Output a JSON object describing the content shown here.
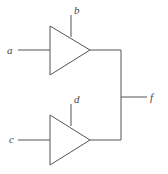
{
  "diagram": {
    "type": "tri-state buffer wired output",
    "stroke_color": "#555555",
    "labels": {
      "input_top": "a",
      "control_top": "b",
      "input_bottom": "c",
      "control_bottom": "d",
      "output": "f"
    },
    "buffers": [
      {
        "name": "top-buffer",
        "input": "a",
        "control": "b"
      },
      {
        "name": "bottom-buffer",
        "input": "c",
        "control": "d"
      }
    ]
  }
}
